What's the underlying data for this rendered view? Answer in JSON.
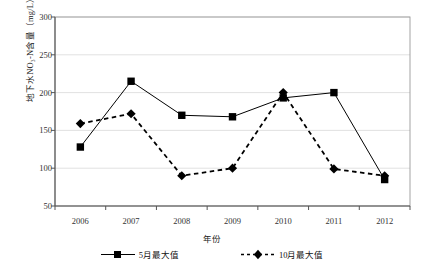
{
  "chart_data": {
    "type": "line",
    "title": "",
    "xlabel": "年份",
    "ylabel": "地下水NO₃-N含量（mg/L）",
    "categories": [
      "2006",
      "2007",
      "2008",
      "2009",
      "2010",
      "2011",
      "2012"
    ],
    "x": [
      2006,
      2007,
      2008,
      2009,
      2010,
      2011,
      2012
    ],
    "ylim": [
      50,
      300
    ],
    "yticks": [
      50,
      100,
      150,
      200,
      250,
      300
    ],
    "grid": "horizontal",
    "legend_position": "bottom",
    "series": [
      {
        "name": "5月最大值",
        "values": [
          128,
          215,
          170,
          168,
          193,
          200,
          85
        ],
        "marker": "square",
        "linestyle": "solid",
        "color": "#000000"
      },
      {
        "name": "10月最大值",
        "values": [
          159,
          172,
          90,
          100,
          200,
          99,
          90
        ],
        "marker": "diamond",
        "linestyle": "dashed",
        "color": "#000000"
      }
    ]
  },
  "legend": {
    "items": [
      {
        "label": "5月最大值"
      },
      {
        "label": "10月最大值"
      }
    ]
  },
  "watermark": {
    "text": ""
  }
}
